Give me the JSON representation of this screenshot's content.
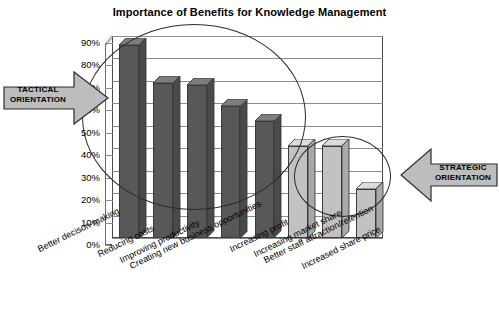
{
  "chart_data": {
    "type": "bar",
    "title": "Importance of Benefits for Knowledge Management",
    "xlabel": "",
    "ylabel": "",
    "ylim": [
      0,
      0.9
    ],
    "grid": true,
    "legend": "none",
    "categories": [
      "Better decison-making",
      "Reducing costs",
      "Improving productivity",
      "Creating new business opportunities",
      "Increasing profit",
      "Increasing market share",
      "Better staff attraction/retention",
      "Increased share price"
    ],
    "values": [
      0.86,
      0.69,
      0.68,
      0.59,
      0.52,
      0.41,
      0.41,
      0.22
    ],
    "value_labels": [
      "86%",
      "69%",
      "68%",
      "59%",
      "52%",
      "41%",
      "41%",
      "22%"
    ],
    "bar_groups": [
      "tactical",
      "tactical",
      "tactical",
      "tactical",
      "tactical",
      "strategic",
      "strategic",
      "strategic"
    ],
    "ytick_labels": [
      "90%",
      "80%",
      "70%",
      "60%",
      "50%",
      "40%",
      "30%",
      "20%",
      "10%",
      "0%"
    ],
    "ytick_values": [
      0.9,
      0.8,
      0.7,
      0.6,
      0.5,
      0.4,
      0.3,
      0.2,
      0.1,
      0.0
    ],
    "colors": {
      "dark_bar": "#585858",
      "light_bar": "#c2c2c2",
      "dark_bar_top": "#7d7d7d",
      "light_bar_top": "#dcdcdc",
      "dark_bar_side": "#4a4a4a",
      "light_bar_side": "#a9a9a9",
      "gridline": "#8c8c8c",
      "outline": "#3a3a3a",
      "annotation_fill": "#bdbdbd",
      "annotation_stroke": "#2c2c2c",
      "background": "#ffffff"
    }
  },
  "annotations": {
    "tactical": {
      "line1": "TACTICAL",
      "line2": "ORIENTATION",
      "direction": "right"
    },
    "strategic": {
      "line1": "STRATEGIC",
      "line2": "ORIENTATION",
      "direction": "left"
    }
  }
}
